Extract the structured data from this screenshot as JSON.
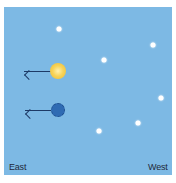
{
  "diagram": {
    "sky_color": "#7db9e4",
    "labels": {
      "left": "East",
      "right": "West"
    },
    "stars": [
      {
        "x": 59,
        "y": 29
      },
      {
        "x": 153,
        "y": 45
      },
      {
        "x": 104,
        "y": 60
      },
      {
        "x": 161,
        "y": 98
      },
      {
        "x": 138,
        "y": 123
      },
      {
        "x": 99,
        "y": 131
      }
    ],
    "sun": {
      "name": "sun",
      "x": 58,
      "y": 71,
      "color": "#f5c842",
      "direction": "east"
    },
    "moon": {
      "name": "moon",
      "x": 58,
      "y": 110,
      "color": "#2f6bb3",
      "direction": "east"
    }
  }
}
